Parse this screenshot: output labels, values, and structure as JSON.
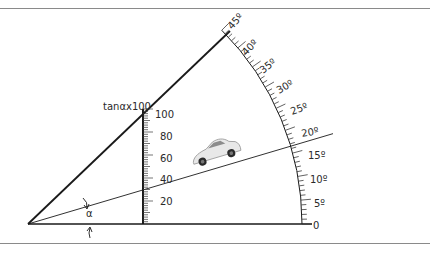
{
  "diagram": {
    "tan_scale_label": "tanαx100",
    "alpha_label": "α",
    "tan_scale": {
      "ticks": [
        "20",
        "40",
        "60",
        "80",
        "100"
      ]
    },
    "angle_scale": {
      "ticks": [
        "0",
        "5º",
        "10º",
        "15º",
        "20º",
        "25º",
        "30º",
        "35º",
        "40º",
        "45º"
      ]
    },
    "incline_angle_deg": 16.5,
    "colors": {
      "line": "#1a1a1a",
      "tick": "#3a3a3a",
      "rule": "#8a8a8a"
    }
  }
}
